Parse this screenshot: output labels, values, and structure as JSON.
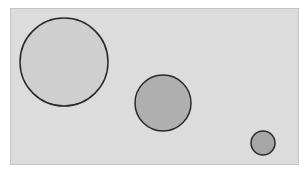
{
  "diagram": {
    "background": "#ffffff",
    "panel": {
      "x": 10,
      "y": 8,
      "width": 289,
      "height": 157,
      "fill": "#dcdcdc",
      "border": "#c4c4c4"
    },
    "circles": [
      {
        "name": "large-circle",
        "cx": 64,
        "cy": 62,
        "r": 44,
        "fill": "#cfcfcf",
        "stroke": "#2a2a2a"
      },
      {
        "name": "medium-circle",
        "cx": 163,
        "cy": 103,
        "r": 28,
        "fill": "#afafaf",
        "stroke": "#2a2a2a"
      },
      {
        "name": "small-circle",
        "cx": 263,
        "cy": 143,
        "r": 12,
        "fill": "#a6a6a6",
        "stroke": "#2a2a2a"
      }
    ]
  }
}
